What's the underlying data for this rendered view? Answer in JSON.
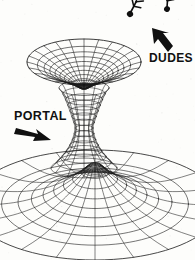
{
  "figure": {
    "background_color": "#fdfdfb",
    "ink_color": "#1a1a1a",
    "width": 195,
    "height": 260
  },
  "labels": {
    "portal": "PORTAL",
    "dudes": "DUDES"
  },
  "annotations": [
    {
      "id": "portal-arrow",
      "points_to": "funnel-throat",
      "direction": "right-down",
      "style": "solid-block-arrow"
    },
    {
      "id": "dudes-arrow",
      "points_to": "stick-figures",
      "direction": "up-left",
      "style": "solid-block-arrow"
    }
  ],
  "objects": {
    "upper_funnel": {
      "name": "upper-funnel-mesh",
      "description": "Wireframe funnel, rim ellipse at top narrowing to dark throat",
      "rim_center_x": 84,
      "rim_center_y": 62,
      "rim_radius_x": 57,
      "rim_radius_y": 23,
      "rings": 11,
      "spokes": 24
    },
    "neck": {
      "name": "wormhole-neck-mesh",
      "description": "Hourglass waist connecting the two funnels",
      "top_y": 88,
      "bottom_y": 168,
      "min_half_width": 9,
      "rings": 14,
      "spokes": 12
    },
    "lower_funnel": {
      "name": "lower-funnel-mesh",
      "description": "Large flared wireframe funnel cropped by frame edges",
      "center_x": 95,
      "center_y": 205,
      "outer_radius_x": 125,
      "outer_radius_y": 55,
      "rings": 10,
      "spokes": 20
    },
    "stick_figures": [
      {
        "name": "stick-figure-left",
        "x": 130,
        "y": 14,
        "rotation_deg": -35,
        "scale": 1.0
      },
      {
        "name": "stick-figure-right",
        "x": 167,
        "y": 9,
        "rotation_deg": -58,
        "scale": 0.95
      }
    ]
  }
}
